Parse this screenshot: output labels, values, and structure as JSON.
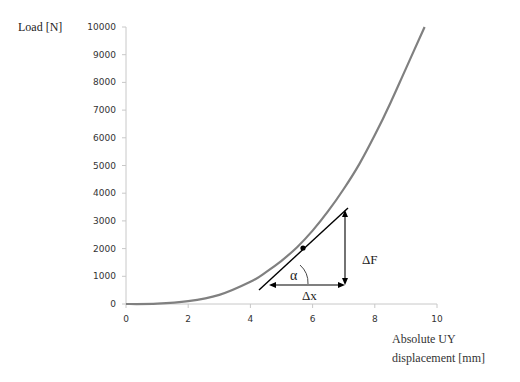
{
  "chart_data": {
    "type": "line",
    "title": "",
    "ylabel": "Load  [N]",
    "xlabel_line1": "Absolute UY",
    "xlabel_line2": "displacement [mm]",
    "xlim": [
      0,
      10
    ],
    "ylim": [
      0,
      10000
    ],
    "x_ticks": [
      "0",
      "2",
      "4",
      "6",
      "8",
      "10"
    ],
    "y_ticks": [
      "0",
      "1000",
      "2000",
      "3000",
      "4000",
      "5000",
      "6000",
      "7000",
      "8000",
      "9000",
      "10000"
    ],
    "grid": false,
    "legend": null,
    "series": [
      {
        "name": "Load-displacement curve",
        "color": "#808080",
        "x": [
          0,
          1,
          2,
          3,
          4,
          4.5,
          5,
          5.5,
          6,
          6.5,
          7,
          7.5,
          8,
          8.5,
          9,
          9.6
        ],
        "y": [
          0,
          10,
          100,
          330,
          800,
          1150,
          1560,
          2050,
          2650,
          3350,
          4150,
          5050,
          6100,
          7250,
          8500,
          10000
        ]
      }
    ],
    "annotations": {
      "tangent_point": {
        "x": 5.6,
        "y": 2050
      },
      "tangent_color": "#000000",
      "alpha_label": "α",
      "delta_f_label": "ΔF",
      "delta_x_label": "Δx"
    }
  }
}
